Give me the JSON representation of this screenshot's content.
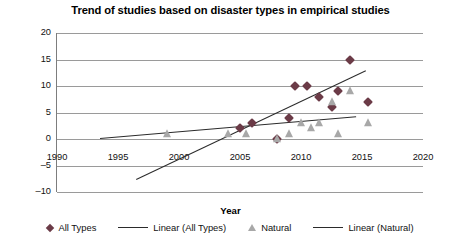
{
  "chart_data": {
    "type": "scatter",
    "title": "Trend of studies based on disaster types in empirical studies",
    "xlabel": "Year",
    "ylabel": "No. of papers",
    "xlim": [
      1990,
      2020
    ],
    "ylim": [
      -10,
      20
    ],
    "xticks": [
      1990,
      1995,
      2000,
      2005,
      2010,
      2015,
      2020
    ],
    "yticks": [
      20,
      15,
      10,
      5,
      0,
      -5,
      -10
    ],
    "grid": "horizontal",
    "legend_position": "bottom",
    "series": [
      {
        "name": "All Types",
        "marker": "diamond",
        "color": "#6b3b47",
        "points": [
          {
            "x": 2005,
            "y": 2
          },
          {
            "x": 2006,
            "y": 3
          },
          {
            "x": 2008,
            "y": 0
          },
          {
            "x": 2009,
            "y": 4
          },
          {
            "x": 2009.5,
            "y": 10
          },
          {
            "x": 2010.5,
            "y": 10
          },
          {
            "x": 2011.5,
            "y": 8
          },
          {
            "x": 2012.5,
            "y": 6
          },
          {
            "x": 2013,
            "y": 9
          },
          {
            "x": 2014,
            "y": 15
          },
          {
            "x": 2015.5,
            "y": 7
          }
        ]
      },
      {
        "name": "Natural",
        "marker": "triangle",
        "color": "#a8a8a8",
        "points": [
          {
            "x": 1999,
            "y": 1
          },
          {
            "x": 2004,
            "y": 1
          },
          {
            "x": 2005.5,
            "y": 1
          },
          {
            "x": 2008,
            "y": 0
          },
          {
            "x": 2009,
            "y": 1
          },
          {
            "x": 2010,
            "y": 3
          },
          {
            "x": 2010.8,
            "y": 2
          },
          {
            "x": 2011.5,
            "y": 3
          },
          {
            "x": 2012.5,
            "y": 7
          },
          {
            "x": 2013,
            "y": 1
          },
          {
            "x": 2014,
            "y": 9
          },
          {
            "x": 2015.5,
            "y": 3
          }
        ]
      }
    ],
    "trendlines": [
      {
        "name": "Linear (All Types)",
        "color": "#2b2b2b",
        "x_start": 1996.5,
        "y_start": -7.5,
        "x_end": 2015.3,
        "y_end": 13.0
      },
      {
        "name": "Linear (Natural)",
        "color": "#2b2b2b",
        "x_start": 1993.5,
        "y_start": 0.2,
        "x_end": 2014.5,
        "y_end": 4.3
      }
    ]
  },
  "legend": {
    "items": [
      {
        "label": "All Types",
        "marker": "diamond"
      },
      {
        "label": "Linear (All Types)",
        "marker": "line"
      },
      {
        "label": "Natural",
        "marker": "triangle"
      },
      {
        "label": "Linear (Natural)",
        "marker": "line"
      }
    ]
  }
}
